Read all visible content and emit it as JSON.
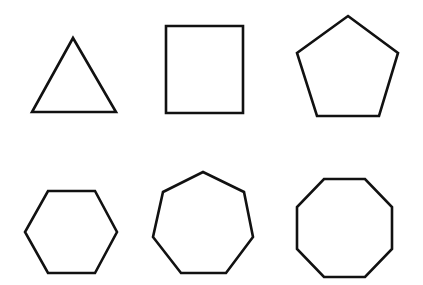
{
  "diagram": {
    "background": "#ffffff",
    "stroke_color": "#111111",
    "stroke_width": 2.6,
    "layout": "2 rows x 3 columns of regular polygons",
    "shapes": [
      {
        "name": "triangle",
        "sides": 3,
        "points": "73,38 32,112 116,112"
      },
      {
        "name": "square",
        "sides": 4,
        "points": "166,26 243,26 243,113 166,113"
      },
      {
        "name": "pentagon",
        "sides": 5,
        "points": "348,16 398,53 379,116 317,116 297,53"
      },
      {
        "name": "hexagon",
        "sides": 6,
        "points": "48,191 95,191 117,232 95,273 48,273 25,232"
      },
      {
        "name": "heptagon",
        "sides": 7,
        "points": "203,172 244,192 253,237 226,273 181,273 153,237 163,192"
      },
      {
        "name": "octagon",
        "sides": 8,
        "points": "324,179 365,179 392,207 392,249 365,277 324,277 297,249 297,207"
      }
    ]
  }
}
